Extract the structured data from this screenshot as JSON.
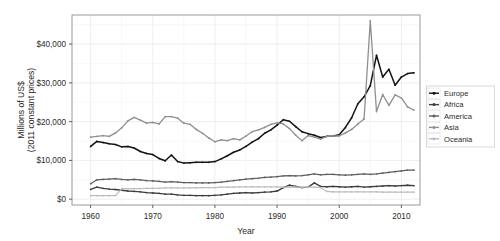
{
  "chart_data": {
    "type": "line",
    "title": "",
    "xlabel": "Year",
    "ylabel": "Millions of US$\n(2011 constant prices)",
    "ylabel_line1": "Millions of US$",
    "ylabel_line2": "(2011 constant prices)",
    "xlim": [
      1957,
      2013
    ],
    "ylim": [
      -1500,
      47500
    ],
    "xticks": [
      1960,
      1970,
      1980,
      1990,
      2000,
      2010
    ],
    "xticklabels": [
      "1960",
      "1970",
      "1980",
      "1990",
      "2000",
      "2010"
    ],
    "yticks": [
      0,
      10000,
      20000,
      30000,
      40000
    ],
    "yticklabels": [
      "$0",
      "$10,000",
      "$20,000",
      "$30,000",
      "$40,000"
    ],
    "grid": true,
    "legend_position": "right",
    "legend_entries": [
      "Europe",
      "Africa",
      "America",
      "Asia",
      "Oceania"
    ],
    "colors": {
      "Europe": "#141414",
      "Africa": "#3d3d3d",
      "America": "#5e5e5e",
      "Asia": "#8f8f8f",
      "Oceania": "#bdbdbd",
      "panel_border": "#9a9a9a",
      "gridline": "#e9eaee"
    },
    "x": [
      1960,
      1961,
      1962,
      1963,
      1964,
      1965,
      1966,
      1967,
      1968,
      1969,
      1970,
      1971,
      1972,
      1973,
      1974,
      1975,
      1976,
      1977,
      1978,
      1979,
      1980,
      1981,
      1982,
      1983,
      1984,
      1985,
      1986,
      1987,
      1988,
      1989,
      1990,
      1991,
      1992,
      1993,
      1994,
      1995,
      1996,
      1997,
      1998,
      1999,
      2000,
      2001,
      2002,
      2003,
      2004,
      2005,
      2006,
      2007,
      2008,
      2009,
      2010,
      2011,
      2012
    ],
    "series": [
      {
        "name": "Europe",
        "color": "#141414",
        "values": [
          13600,
          14900,
          14600,
          14300,
          14100,
          13500,
          13600,
          13200,
          12300,
          11800,
          11500,
          10500,
          9900,
          11400,
          9700,
          9300,
          9400,
          9500,
          9500,
          9500,
          9700,
          10400,
          11200,
          12100,
          12700,
          13600,
          14700,
          15600,
          17000,
          17900,
          19100,
          20500,
          20100,
          18700,
          17400,
          16900,
          16500,
          15900,
          16200,
          16300,
          16600,
          18500,
          21000,
          24600,
          26400,
          29300,
          37100,
          31500,
          33500,
          29400,
          31500,
          32400,
          32600
        ]
      },
      {
        "name": "Africa",
        "color": "#3d3d3d",
        "values": [
          2500,
          3100,
          2800,
          2600,
          2500,
          2300,
          2100,
          2000,
          1900,
          1700,
          1600,
          1500,
          1300,
          1300,
          1100,
          1000,
          1000,
          900,
          900,
          900,
          1000,
          1100,
          1300,
          1500,
          1600,
          1700,
          1600,
          1700,
          1800,
          1900,
          2100,
          3000,
          3600,
          3300,
          3000,
          3100,
          4200,
          3300,
          3200,
          3300,
          3200,
          3100,
          3200,
          3300,
          3100,
          3200,
          3300,
          3400,
          3500,
          3400,
          3500,
          3600,
          3500
        ]
      },
      {
        "name": "America",
        "color": "#5e5e5e",
        "values": [
          4000,
          5000,
          5100,
          5200,
          5300,
          5100,
          5000,
          5100,
          5000,
          4800,
          4700,
          4600,
          4400,
          4500,
          4400,
          4300,
          4300,
          4200,
          4200,
          4200,
          4300,
          4400,
          4600,
          4800,
          5000,
          5200,
          5300,
          5400,
          5600,
          5700,
          5800,
          6000,
          6100,
          6000,
          6100,
          6300,
          6500,
          6300,
          6400,
          6400,
          6300,
          6200,
          6300,
          6400,
          6500,
          6400,
          6500,
          6700,
          6900,
          7100,
          7300,
          7500,
          7500
        ]
      },
      {
        "name": "Asia",
        "color": "#8f8f8f",
        "values": [
          16000,
          16200,
          16400,
          16200,
          17100,
          18400,
          20200,
          21100,
          20400,
          19600,
          19800,
          19400,
          21300,
          21300,
          20900,
          19600,
          19300,
          18000,
          17000,
          15800,
          14800,
          15300,
          15100,
          15600,
          15300,
          16300,
          17400,
          17900,
          18500,
          19300,
          19700,
          19400,
          18200,
          16500,
          15100,
          16400,
          16000,
          15500,
          16200,
          16300,
          16300,
          17100,
          18000,
          19400,
          20700,
          46000,
          22600,
          27000,
          24200,
          26900,
          26100,
          23800,
          23000
        ]
      },
      {
        "name": "Oceania",
        "color": "#bdbdbd",
        "values": [
          900,
          900,
          900,
          900,
          900,
          2700,
          2700,
          2700,
          2700,
          2800,
          2800,
          2800,
          2900,
          2900,
          2900,
          2900,
          2900,
          2900,
          3000,
          3000,
          3000,
          3100,
          3100,
          3100,
          3200,
          3200,
          3200,
          3200,
          3200,
          3200,
          3200,
          3100,
          3100,
          3100,
          3100,
          3100,
          3100,
          3000,
          2000,
          1900,
          1900,
          1900,
          1900,
          1900,
          1900,
          1900,
          1900,
          1800,
          1800,
          1800,
          1800,
          1800,
          1800
        ]
      }
    ]
  }
}
